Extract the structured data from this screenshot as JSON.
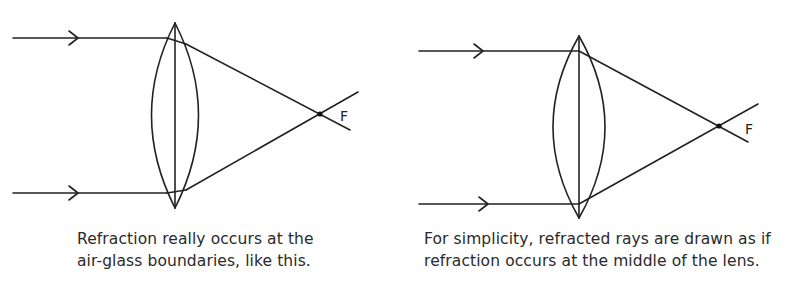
{
  "colors": {
    "ink": "#222222",
    "background": "#ffffff",
    "caption": "#2a2a2a"
  },
  "panels": [
    {
      "id": "left",
      "focal_label": "F",
      "caption_lines": [
        "Refraction really occurs at the",
        "air-glass boundaries, like this."
      ],
      "refraction_model": "air-glass boundaries"
    },
    {
      "id": "right",
      "focal_label": "F",
      "caption_lines": [
        "For simplicity, refracted rays are drawn as if",
        "refraction occurs at the middle of the lens."
      ],
      "refraction_model": "middle of lens"
    }
  ]
}
